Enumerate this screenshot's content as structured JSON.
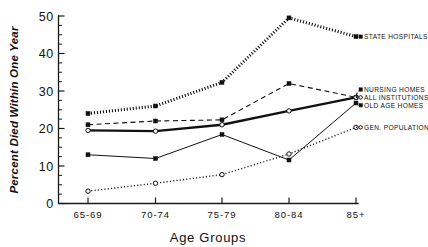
{
  "chart_data": {
    "type": "line",
    "title": "",
    "xlabel": "Age Groups",
    "ylabel": "Percent Died Within One Year",
    "categories": [
      "65-69",
      "70-74",
      "75-79",
      "80-84",
      "85+"
    ],
    "ylim": [
      0,
      50
    ],
    "yticks": [
      0,
      10,
      20,
      30,
      40,
      50
    ],
    "ytick_labels": [
      "0",
      "10",
      "20",
      "30",
      "40",
      "50"
    ],
    "minor_tick_step": 2.5,
    "grid": false,
    "legend_position": "right-inline",
    "series": [
      {
        "name": "STATE HOSPITALS",
        "values": [
          24.0,
          26.0,
          32.3,
          49.5,
          44.5
        ],
        "line_style": "dotted-heavy",
        "marker": "filled-square",
        "label_y": 44.5
      },
      {
        "name": "NURSING HOMES",
        "values": [
          21.0,
          22.0,
          22.3,
          32.0,
          28.3
        ],
        "line_style": "dashed",
        "marker": "filled-square",
        "label_y": 30.4
      },
      {
        "name": "ALL INSTITUTIONS",
        "values": [
          19.5,
          19.3,
          21.0,
          24.7,
          28.3
        ],
        "line_style": "solid-thick",
        "marker": "open-circle",
        "label_y": 28.3
      },
      {
        "name": "OLD AGE HOMES",
        "values": [
          13.0,
          12.0,
          18.4,
          11.6,
          26.8
        ],
        "line_style": "solid-thin",
        "marker": "filled-square",
        "label_y": 26.2
      },
      {
        "name": "GEN. POPULATION",
        "values": [
          3.3,
          5.4,
          7.7,
          13.2,
          20.3
        ],
        "line_style": "dotted-fine",
        "marker": "open-circle",
        "label_y": 20.3
      }
    ]
  },
  "axis": {
    "y_title": "Percent Died Within One Year",
    "x_title": "Age Groups",
    "y_labels": [
      "50",
      "40",
      "30",
      "20",
      "10",
      "0"
    ],
    "x_labels": [
      "65-69",
      "70-74",
      "75-79",
      "80-84",
      "85+"
    ]
  },
  "legend": {
    "items": [
      "STATE HOSPITALS",
      "NURSING HOMES",
      "ALL INSTITUTIONS",
      "OLD AGE HOMES",
      "GEN. POPULATION"
    ]
  }
}
